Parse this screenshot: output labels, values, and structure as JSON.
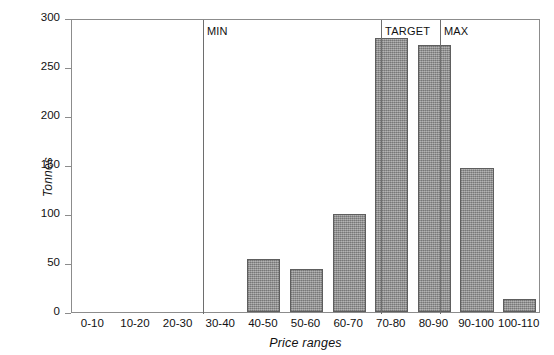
{
  "chart_data": {
    "type": "bar",
    "title": "",
    "xlabel": "Price ranges",
    "ylabel": "Tonnes",
    "categories": [
      "0-10",
      "10-20",
      "20-30",
      "30-40",
      "40-50",
      "50-60",
      "60-70",
      "70-80",
      "80-90",
      "90-100",
      "100-110"
    ],
    "values": [
      0,
      0,
      0,
      0,
      54,
      44,
      100,
      280,
      272,
      147,
      13
    ],
    "ylim": [
      0,
      300
    ],
    "yticks": [
      0,
      50,
      100,
      150,
      200,
      250,
      300
    ],
    "ytick_labels": [
      "0",
      "50",
      "100",
      "150",
      "200",
      "250",
      "300"
    ],
    "grid": false,
    "legend": "none",
    "bar_color": "#989898",
    "bar_edge_color": "#5e5e5e",
    "axis_color": "#8c8c8c",
    "annotations": [
      {
        "label": "MIN",
        "x_value": 30.7
      },
      {
        "label": "TARGET",
        "x_value": 72.5
      },
      {
        "label": "MAX",
        "x_value": 86.3
      }
    ]
  }
}
